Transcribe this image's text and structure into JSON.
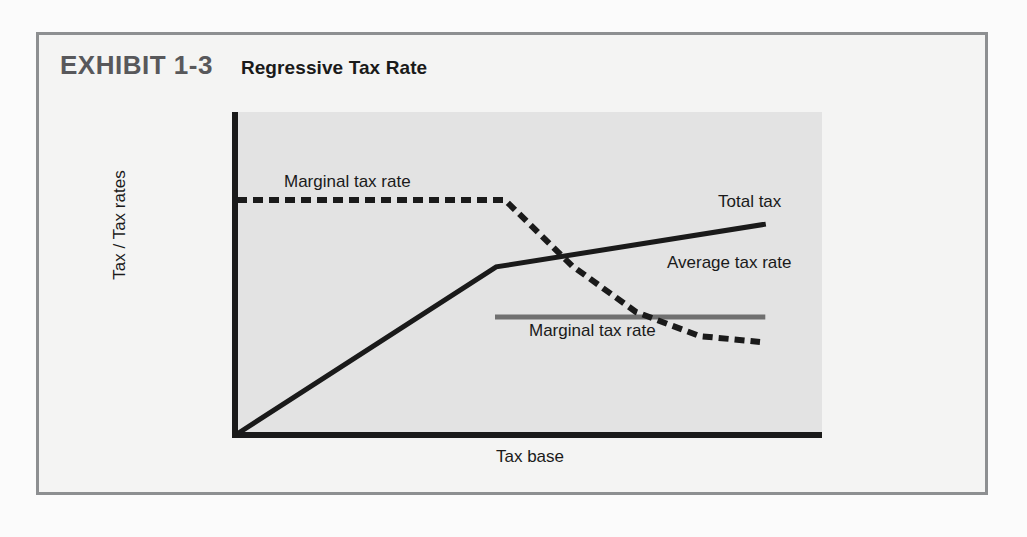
{
  "exhibit": {
    "number": "EXHIBIT 1-3",
    "title": "Regressive Tax Rate"
  },
  "colors": {
    "frame_border": "#8d8f91",
    "page_background": "#fbfbfb",
    "panel_background": "#f4f4f3",
    "plot_background": "#e3e3e3",
    "axis": "#1a1a1a",
    "total_tax_line": "#1a1a1a",
    "average_tax_rate_line": "#1a1a1a",
    "marginal_tax_rate_line": "#707070",
    "exhibit_number_text": "#58585b",
    "title_text": "#1a1a1a"
  },
  "chart_data": {
    "type": "line",
    "title": "Regressive Tax Rate",
    "xlabel": "Tax base",
    "ylabel": "Tax / Tax rates",
    "xlim": [
      0,
      100
    ],
    "ylim": [
      0,
      100
    ],
    "grid": false,
    "legend": "inline-annotations",
    "axis_ticks": {
      "x": [],
      "y": []
    },
    "series": [
      {
        "name": "Total tax",
        "style": "solid",
        "color": "#1a1a1a",
        "label_text": "Total tax",
        "points": [
          {
            "x": 0,
            "y": 0
          },
          {
            "x": 44.3,
            "y": 51.9
          },
          {
            "x": 90.4,
            "y": 65.2
          }
        ]
      },
      {
        "name": "Average tax rate",
        "style": "dashed",
        "color": "#1a1a1a",
        "label_text": "Average tax rate",
        "top_label_text": "Marginal tax rate",
        "points": [
          {
            "x": 0,
            "y": 72.7
          },
          {
            "x": 45.8,
            "y": 72.7
          },
          {
            "x": 57.3,
            "y": 52.2
          },
          {
            "x": 68.2,
            "y": 37.9
          },
          {
            "x": 79.1,
            "y": 30.4
          },
          {
            "x": 89.4,
            "y": 28.6
          }
        ]
      },
      {
        "name": "Marginal tax rate",
        "style": "solid",
        "color": "#707070",
        "label_text": "Marginal tax rate",
        "points": [
          {
            "x": 44.1,
            "y": 36.3
          },
          {
            "x": 90.3,
            "y": 36.3
          }
        ]
      }
    ],
    "annotations": [
      {
        "text": "Marginal tax rate",
        "series": "Average tax rate",
        "position": "top-left"
      },
      {
        "text": "Total tax",
        "series": "Total tax",
        "position": "right"
      },
      {
        "text": "Average tax rate",
        "series": "Average tax rate",
        "position": "right"
      },
      {
        "text": "Marginal tax rate",
        "series": "Marginal tax rate",
        "position": "below-line"
      }
    ]
  }
}
